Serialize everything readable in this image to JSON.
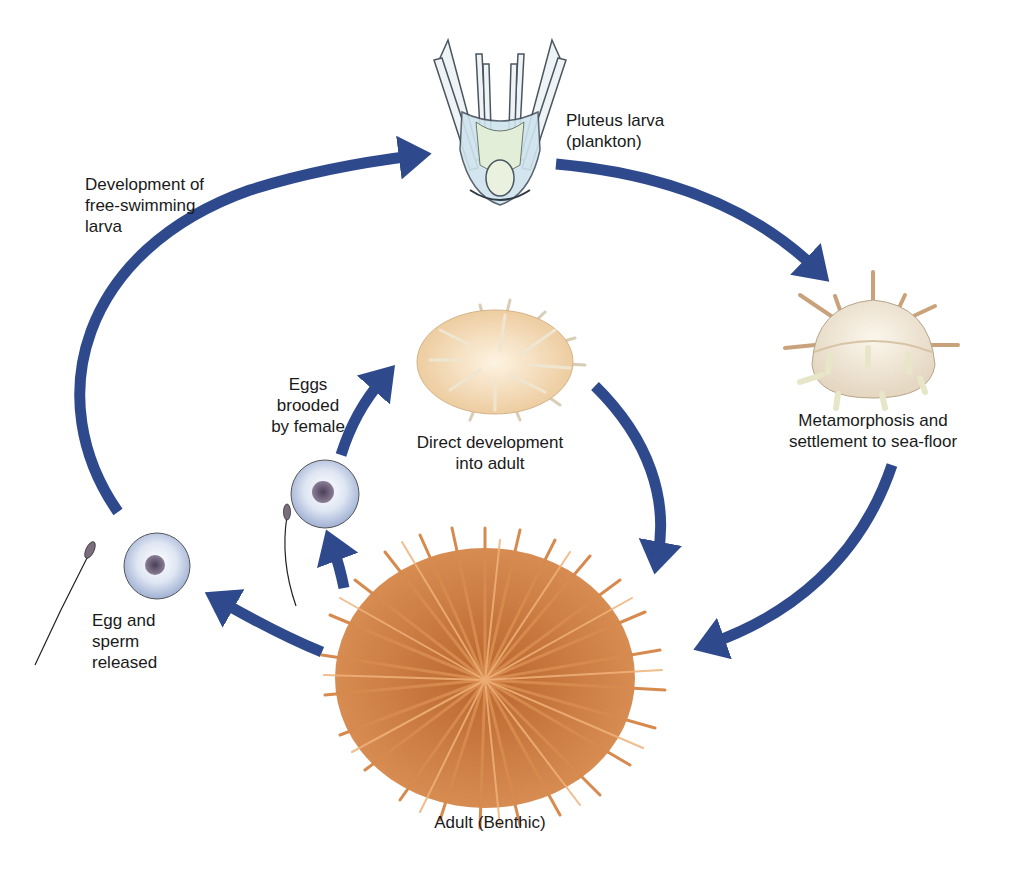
{
  "diagram": {
    "type": "life-cycle",
    "accent_color": "#2f4a8c",
    "spine_color": "#c97a3f",
    "labels": {
      "pluteus": "Pluteus larva\n(plankton)",
      "free_swimming": "Development of\nfree-swimming\nlarva",
      "metamorphosis": "Metamorphosis and\nsettlement to sea-floor",
      "brooded": "Eggs\nbrooded\nby female",
      "direct": "Direct development\ninto adult",
      "egg_sperm": "Egg and\nsperm\nreleased",
      "adult": "Adult (Benthic)"
    },
    "stages": [
      {
        "id": "adult",
        "name": "Adult (Benthic)"
      },
      {
        "id": "egg-sperm",
        "name": "Egg and sperm released"
      },
      {
        "id": "pluteus",
        "name": "Pluteus larva (plankton)"
      },
      {
        "id": "juvenile",
        "name": "Metamorphosis and settlement to sea-floor"
      },
      {
        "id": "brooded-egg",
        "name": "Eggs brooded by female"
      },
      {
        "id": "direct-juvenile",
        "name": "Direct development into adult"
      }
    ],
    "edges": [
      {
        "from": "adult",
        "to": "egg-sperm"
      },
      {
        "from": "egg-sperm",
        "to": "pluteus",
        "label": "Development of free-swimming larva"
      },
      {
        "from": "pluteus",
        "to": "juvenile"
      },
      {
        "from": "juvenile",
        "to": "adult"
      },
      {
        "from": "adult",
        "to": "brooded-egg"
      },
      {
        "from": "brooded-egg",
        "to": "direct-juvenile"
      },
      {
        "from": "direct-juvenile",
        "to": "adult"
      }
    ]
  }
}
